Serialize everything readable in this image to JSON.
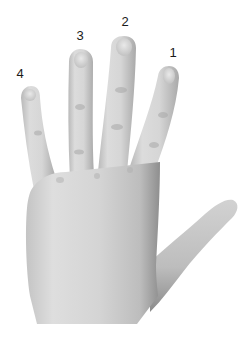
{
  "figure": {
    "style": "grayscale photograph",
    "background_color": "#ffffff",
    "skin_tone_light": "#e4e4e4",
    "skin_tone_mid": "#cfcfcf",
    "skin_tone_shadow": "#9a9a9a",
    "label_color": "#1a1a1a"
  },
  "labels": [
    {
      "text": "1",
      "finger": "index",
      "x": 173,
      "y": 52
    },
    {
      "text": "2",
      "finger": "middle",
      "x": 125,
      "y": 21
    },
    {
      "text": "3",
      "finger": "ring",
      "x": 80,
      "y": 35
    },
    {
      "text": "4",
      "finger": "pinky",
      "x": 20,
      "y": 73
    }
  ],
  "caption": {
    "text": ""
  }
}
